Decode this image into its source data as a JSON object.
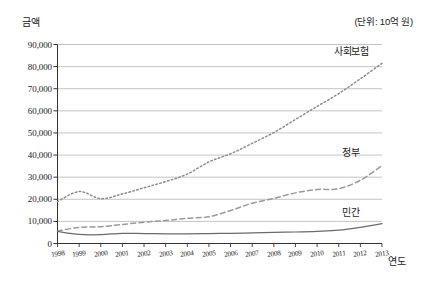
{
  "chart_data": {
    "type": "line",
    "title": "",
    "unit_note": "(단위: 10억 원)",
    "ylabel": "금액",
    "xlabel": "연도",
    "grid": true,
    "legend_position": "inline-right",
    "ylim": [
      0,
      90000
    ],
    "ytick_labels": [
      "90,000",
      "80,000",
      "70,000",
      "60,000",
      "50,000",
      "40,000",
      "30,000",
      "20,000",
      "10,000",
      "0"
    ],
    "ytick_values": [
      90000,
      80000,
      70000,
      60000,
      50000,
      40000,
      30000,
      20000,
      10000,
      0
    ],
    "categories": [
      "1998",
      "1999",
      "2000",
      "2001",
      "2002",
      "2003",
      "2004",
      "2005",
      "2006",
      "2007",
      "2008",
      "2009",
      "2010",
      "2011",
      "2012",
      "2013"
    ],
    "x": [
      1998,
      1999,
      2000,
      2001,
      2002,
      2003,
      2004,
      2005,
      2006,
      2007,
      2008,
      2009,
      2010,
      2011,
      2012,
      2013
    ],
    "series": [
      {
        "name": "사회보험",
        "style": "dotted",
        "color": "#8c8c8c",
        "values": [
          18900,
          23500,
          20300,
          22400,
          25200,
          28000,
          31400,
          36900,
          40600,
          45300,
          50200,
          56100,
          62000,
          67800,
          74500,
          81500
        ]
      },
      {
        "name": "정부",
        "style": "dashed",
        "color": "#9a9a9a",
        "values": [
          5600,
          7300,
          7600,
          8600,
          9600,
          10400,
          11400,
          12100,
          14900,
          18200,
          20400,
          22900,
          24400,
          24800,
          28600,
          35200
        ]
      },
      {
        "name": "민간",
        "style": "solid",
        "color": "#6b6b6b",
        "values": [
          5500,
          4100,
          4000,
          4600,
          4500,
          4400,
          4400,
          4500,
          4600,
          4800,
          5000,
          5200,
          5500,
          6000,
          7300,
          9000
        ]
      }
    ]
  }
}
